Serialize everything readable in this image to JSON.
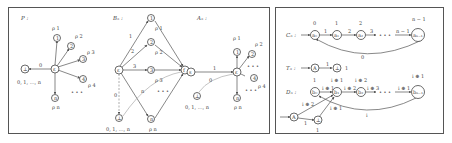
{
  "panels": {
    "left": {
      "automata": [
        {
          "title": "P :",
          "nodes": [
            "⊥",
            "ε",
            "1",
            "2",
            "3",
            "4",
            "n"
          ],
          "loop_labels": [
            "ρ 1",
            "ρ 2",
            "ρ 3",
            "ρ 4",
            "ρ n"
          ],
          "edge_labels": [
            "1",
            "2",
            "3",
            "4",
            "n",
            "0"
          ],
          "sink_label": "0, 1, ..., n",
          "ellipsis": "• • •"
        },
        {
          "title": "Bₙ :",
          "nodes": [
            "ε",
            "1",
            "2",
            "3",
            "n",
            "⊥",
            "f"
          ],
          "loop_labels": [
            "ρ 1",
            "ρ 2",
            "ρ 3",
            "ρ n"
          ],
          "edge_labels": [
            "1",
            "2",
            "3",
            "n",
            "0",
            "3",
            "1",
            "3"
          ],
          "sink_label": "0, 1, ..., n",
          "ellipsis": "• • •"
        },
        {
          "title": "Aₙ :",
          "nodes": [
            "s",
            "ε",
            "1",
            "2",
            "4",
            "n",
            "⊥"
          ],
          "loop_labels": [
            "ρ 1",
            "ρ 2",
            "ρ 4",
            "ρ n"
          ],
          "edge_labels": [
            "1",
            "1",
            "2",
            "ε",
            "n",
            "0"
          ],
          "sink_label": "0, 1, ..., n",
          "ellipsis": "• • •"
        }
      ]
    },
    "right": {
      "automata": [
        {
          "title": "Cₙ :",
          "nodes": [
            "a₀",
            "a₁",
            "a₂",
            "aₙ₋₁"
          ],
          "loop_labels": [
            "0",
            "1",
            "2",
            "n − 1"
          ],
          "edge_labels": [
            "1",
            "2",
            "3",
            "n − 1",
            "0"
          ],
          "ellipsis": "• • •"
        },
        {
          "title": "Tₙ :",
          "nodes": [
            "A",
            "⊥"
          ],
          "edge_labels": [
            "1"
          ],
          "loop_labels": [
            "1"
          ]
        },
        {
          "title": "Dₙ :",
          "nodes": [
            "b₀",
            "b₁",
            "b₂",
            "bₙ₋₁",
            "A",
            "⊥"
          ],
          "loop_labels": [
            "1",
            "i ⊕ 1",
            "i ⊕ 2",
            "i ⊕ 1",
            "1"
          ],
          "edge_labels": [
            "i ⊕ 1",
            "i ⊕ 2",
            "i ⊕ 3",
            "i ⊕ 1",
            "i ⊕ 2",
            "i ⊕ 1",
            "1",
            "i"
          ],
          "ellipsis": "• • •"
        }
      ]
    }
  }
}
